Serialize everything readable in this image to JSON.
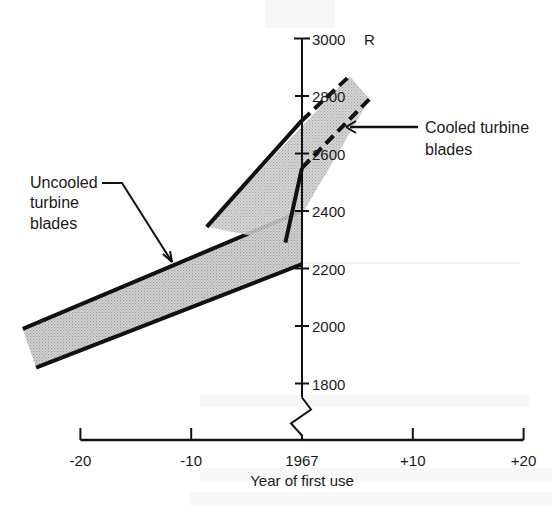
{
  "chart_data": {
    "type": "area",
    "title": "",
    "xlabel": "Year of first use",
    "ylabel": "R",
    "x_ticks": [
      {
        "value": -20,
        "label": "-20"
      },
      {
        "value": -10,
        "label": "-10"
      },
      {
        "value": 0,
        "label": "1967"
      },
      {
        "value": 10,
        "label": "+10"
      },
      {
        "value": 20,
        "label": "+20"
      }
    ],
    "y_ticks": [
      {
        "value": 3000,
        "label": "3000"
      },
      {
        "value": 2800,
        "label": "2800"
      },
      {
        "value": 2600,
        "label": "2600"
      },
      {
        "value": 2400,
        "label": "2400"
      },
      {
        "value": 2200,
        "label": "2200"
      },
      {
        "value": 2000,
        "label": "2000"
      },
      {
        "value": 1800,
        "label": "1800"
      }
    ],
    "y_unit_label": "R",
    "xlim": [
      -20,
      20
    ],
    "ylim": [
      1800,
      3000
    ],
    "y_axis_break": true,
    "grid": false,
    "legend": "none",
    "series": [
      {
        "name": "Uncooled turbine blades",
        "label_lines": [
          "Uncooled",
          "turbine",
          "blades"
        ],
        "upper": [
          {
            "x": -25.2,
            "y": 1990
          },
          {
            "x": 0,
            "y": 2400
          }
        ],
        "lower": [
          {
            "x": -24.0,
            "y": 1855
          },
          {
            "x": 0,
            "y": 2215
          }
        ],
        "fill": "#c8c8c8"
      },
      {
        "name": "Cooled turbine blades",
        "label_lines": [
          "Cooled turbine",
          "blades"
        ],
        "upper_solid": [
          {
            "x": -8.6,
            "y": 2345
          },
          {
            "x": 0,
            "y": 2715
          }
        ],
        "upper_dashed": [
          {
            "x": 0,
            "y": 2715
          },
          {
            "x": 4.3,
            "y": 2870
          }
        ],
        "lower_solid": [
          {
            "x": -1.5,
            "y": 2290
          },
          {
            "x": 0,
            "y": 2550
          }
        ],
        "lower_dashed": [
          {
            "x": 0,
            "y": 2550
          },
          {
            "x": 6.1,
            "y": 2790
          }
        ],
        "fill": "#cfcfcf"
      }
    ],
    "annotations": [
      {
        "text": "Cooled turbine blades",
        "points_to": "Cooled turbine blades band"
      },
      {
        "text": "Uncooled turbine blades",
        "points_to": "Uncooled turbine blades band"
      }
    ]
  }
}
